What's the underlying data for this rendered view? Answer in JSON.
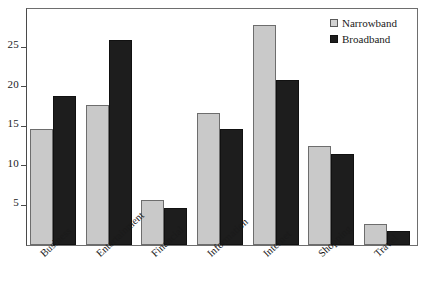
{
  "chart_data": {
    "type": "bar",
    "title": "",
    "xlabel": "",
    "ylabel": "",
    "categories": [
      "Business",
      "Entertainment",
      "Financial",
      "Information",
      "Internet",
      "Shopping",
      "Travel"
    ],
    "series": [
      {
        "name": "Narrowband",
        "color": "#c9c9c9",
        "values": [
          14.7,
          17.7,
          5.7,
          16.7,
          27.8,
          12.5,
          2.7
        ]
      },
      {
        "name": "Broadband",
        "color": "#1d1d1d",
        "values": [
          18.8,
          25.9,
          4.7,
          14.6,
          20.8,
          11.5,
          1.8
        ]
      }
    ],
    "yticks": [
      5,
      10,
      15,
      20,
      25
    ],
    "ytick_labels": [
      "5",
      "10",
      "15",
      "20",
      "25"
    ],
    "ylim": [
      0,
      29.8
    ],
    "grid": false,
    "legend_position": "top-right",
    "xtick_rotation": -43
  },
  "legend": {
    "items": [
      {
        "label": "Narrowband",
        "swatch": "narrow"
      },
      {
        "label": "Broadband",
        "swatch": "broad"
      }
    ]
  }
}
